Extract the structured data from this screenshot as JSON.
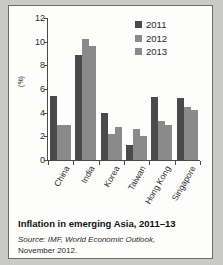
{
  "chart_data": {
    "type": "bar",
    "title": "",
    "xlabel": "",
    "ylabel": "(%)",
    "ylim": [
      0,
      12
    ],
    "yticks": [
      0,
      2,
      4,
      6,
      8,
      10,
      12
    ],
    "grid": false,
    "legend_position": "top-right",
    "categories": [
      "China",
      "India",
      "Korea",
      "Taiwan",
      "Hong Kong",
      "Singapore"
    ],
    "series": [
      {
        "name": "2011",
        "color": "#4a4a4a",
        "values": [
          5.4,
          8.9,
          4.0,
          1.3,
          5.3,
          5.2
        ]
      },
      {
        "name": "2012",
        "color": "#8a8a8a",
        "values": [
          3.0,
          10.2,
          2.2,
          2.6,
          3.3,
          4.5
        ]
      },
      {
        "name": "2013",
        "color": "#8a8a8a",
        "values": [
          3.0,
          9.6,
          2.8,
          2.0,
          3.0,
          4.2
        ]
      }
    ]
  },
  "caption": {
    "title": "Inflation in emerging Asia, 2011–13",
    "source_line_1": "Source: IMF, World Economic Outlook,",
    "source_line_2": "November 2012."
  }
}
